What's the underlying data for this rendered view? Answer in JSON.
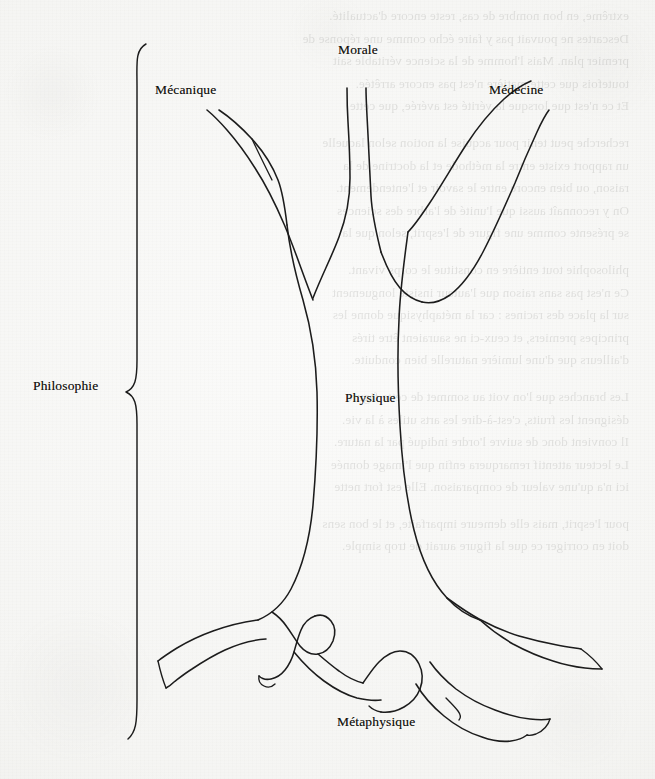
{
  "figure": {
    "ink_color": "#1c1c1c",
    "paper_color": "#f6f6f4"
  },
  "labels": {
    "mecanique": "Mécanique",
    "morale": "Morale",
    "medecine": "Médecine",
    "philosophie": "Philosophie",
    "physique": "Physique",
    "metaphysique": "Métaphysique"
  },
  "parts": {
    "roots": "Métaphysique",
    "trunk": "Physique",
    "branches": [
      "Mécanique",
      "Morale",
      "Médecine"
    ],
    "whole": "Philosophie"
  },
  "brace": {
    "orientation": "left",
    "groups": "Philosophie"
  },
  "bleed_through": [
    "extrême, en bon nombre de cas, reste encore d'actualité.",
    "Descartes ne pouvait pas y faire écho comme une réponse de",
    "premier plan. Mais l'homme de la science véritable sait",
    "toutefois que cette matière n'est pas encore arrêtée.",
    "Et ce n'est que lorsque la vérité est avérée, que cette",
    "recherche peut tenir pour acquise la notion selon laquelle",
    "un rapport existe entre la méthode et la doctrine de la",
    "raison, ou bien encore entre le savoir et l'entendement.",
    "On y reconnaît aussi que l'unité de l'arbre des sciences",
    "se présente comme une figure de l'esprit, selon que la",
    "philosophie tout entière en constitue le corps vivant.",
    "Ce n'est pas sans raison que l'auteur insiste longuement",
    "sur la place des racines : car la métaphysique donne les",
    "principes premiers, et ceux-ci ne sauraient être tirés",
    "d'ailleurs que d'une lumière naturelle bien conduite.",
    "Les branches que l'on voit au sommet de cette figure",
    "désignent les fruits, c'est-à-dire les arts utiles à la vie.",
    "Il convient donc de suivre l'ordre indiqué par la nature.",
    "Le lecteur attentif remarquera enfin que l'image donnée",
    "ici n'a qu'une valeur de comparaison. Elle est fort nette",
    "pour l'esprit, mais elle demeure imparfaite, et le bon sens",
    "doit en corriger ce que la figure aurait de trop simple."
  ]
}
